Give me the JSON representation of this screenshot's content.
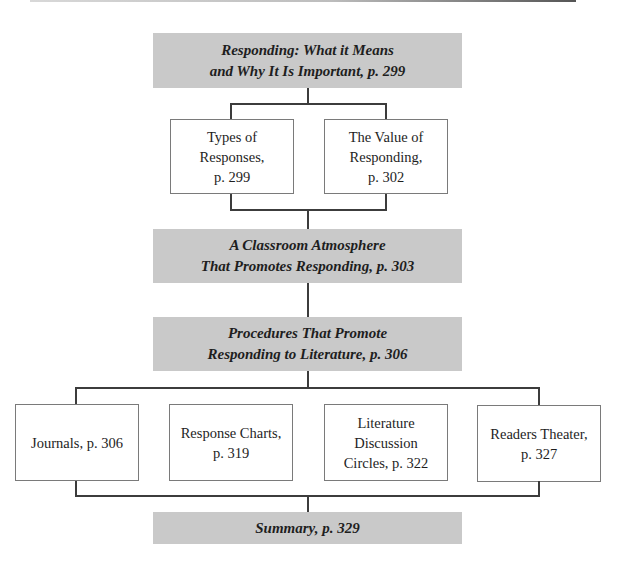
{
  "diagram": {
    "type": "chapter-outline-flowchart",
    "colors": {
      "section_fill": "#c9c9c9",
      "subsection_fill": "#ffffff",
      "connector": "#3c3c3c",
      "subsection_border": "#7a7a7a"
    },
    "sections": [
      {
        "id": "responding",
        "line1": "Responding: What it Means",
        "line2": "and Why It Is Important, p. 299",
        "subsections": [
          {
            "line1": "Types of",
            "line2": "Responses,",
            "line3": "p. 299"
          },
          {
            "line1": "The Value of",
            "line2": "Responding,",
            "line3": "p. 302"
          }
        ]
      },
      {
        "id": "classroom-atmosphere",
        "line1": "A Classroom Atmosphere",
        "line2": "That Promotes Responding, p. 303",
        "subsections": []
      },
      {
        "id": "procedures",
        "line1": "Procedures That Promote",
        "line2": "Responding to Literature, p. 306",
        "subsections": [
          {
            "line1": "Journals, p. 306"
          },
          {
            "line1": "Response Charts,",
            "line2": "p. 319"
          },
          {
            "line1": "Literature",
            "line2": "Discussion",
            "line3": "Circles, p. 322"
          },
          {
            "line1": "Readers Theater,",
            "line2": "p. 327"
          }
        ]
      },
      {
        "id": "summary",
        "line1": "Summary, p. 329",
        "subsections": []
      }
    ]
  }
}
